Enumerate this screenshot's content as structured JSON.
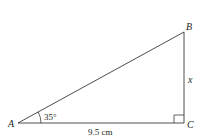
{
  "diagram": {
    "type": "right-triangle",
    "vertices": [
      {
        "name": "A",
        "label": "A"
      },
      {
        "name": "B",
        "label": "B"
      },
      {
        "name": "C",
        "label": "C"
      }
    ],
    "angle_A": {
      "label": "35°"
    },
    "side_AC": {
      "label": "9.5 cm"
    },
    "side_BC": {
      "label": "x"
    },
    "right_angle_at": "C",
    "colors": {
      "stroke": "#231f20",
      "background": "#ffffff"
    }
  }
}
